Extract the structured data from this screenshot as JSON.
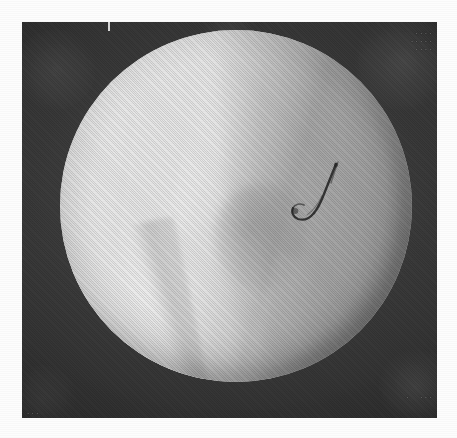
{
  "image": {
    "kind": "fluoroscopic-radiograph",
    "modality_label": "Fluoroscopy",
    "orientation": "portrait",
    "canvas": {
      "width": 457,
      "height": 438
    },
    "page_margin_px": 22,
    "plate": {
      "x": 22,
      "y": 22,
      "width": 415,
      "height": 396,
      "background_color": "#2b2b2b",
      "description": "Dark collimated surround of the image intensifier"
    },
    "field_of_view": {
      "shape": "circle",
      "center_x": 236,
      "center_y": 206,
      "radius": 176,
      "bright_color": "#cfcfcf",
      "mid_color": "#a8a8a8",
      "dark_color": "#6e6e6e",
      "description": "Circular image-intensifier field of view"
    },
    "features": [
      {
        "name": "bone-shaft",
        "label": "Bright longitudinal bone shaft",
        "position": "left-of-centre, oblique",
        "relative_density": "high"
      },
      {
        "name": "cortical-margin-medial",
        "label": "Cortical margin, top-centre to lower-left",
        "position": "centre",
        "relative_density": "step"
      },
      {
        "name": "soft-tissue-wedge",
        "label": "Darker soft-tissue wedge",
        "position": "right third",
        "relative_density": "low"
      },
      {
        "name": "distal-wedge",
        "label": "Bright distal bone wedge",
        "position": "lower-left quadrant",
        "relative_density": "high"
      },
      {
        "name": "device-tip",
        "label": "Radio-dense hook-shaped device tip",
        "position": "right of centre",
        "center_x": 312,
        "center_y": 204,
        "relative_density": "very high"
      }
    ]
  },
  "annotations": {
    "top_right": "....\n.....\n....",
    "bottom_right": ".  ...",
    "bottom_left": "...",
    "top_tick_label": ""
  },
  "colors": {
    "paper": "#fdfdfd",
    "surround": "#2b2b2b",
    "fov_bright": "#e8e8e8",
    "fov_base": "#c6c6c6",
    "fov_dark": "#6e6e6e",
    "device": "#1f1f1f"
  }
}
